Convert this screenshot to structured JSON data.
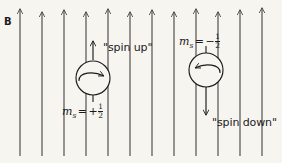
{
  "figure": {
    "background_color": "#f7f5f0",
    "ink_color": "#1b1b1b",
    "width": 282,
    "height": 163
  },
  "field": {
    "label": "B",
    "label_meaning": "magnetic field",
    "arrow_direction": "up",
    "arrow_count": 12,
    "arrow_x_positions": [
      20,
      42,
      64,
      86,
      108,
      130,
      152,
      174,
      196,
      218,
      240,
      262
    ],
    "arrow_top_y": 8,
    "arrow_bottom_y": 156
  },
  "spin_up": {
    "ms_label_prefix": "m",
    "ms_label_subscript": "s",
    "ms_label_equals": "=",
    "ms_label_sign": "+",
    "ms_numerator": "1",
    "ms_denominator": "2",
    "ms_label_plain": "m_s = +1/2",
    "quote_label": "\"spin up\"",
    "moment_arrow_direction": "up",
    "rotation_direction": "clockwise-from-above",
    "circle_center_x": 93,
    "circle_center_y": 78,
    "circle_radius": 17
  },
  "spin_down": {
    "ms_label_prefix": "m",
    "ms_label_subscript": "s",
    "ms_label_equals": "=",
    "ms_label_sign": "−",
    "ms_numerator": "1",
    "ms_denominator": "2",
    "ms_label_plain": "m_s = -1/2",
    "quote_label": "\"spin down\"",
    "moment_arrow_direction": "down",
    "rotation_direction": "counterclockwise-from-above",
    "circle_center_x": 206,
    "circle_center_y": 70,
    "circle_radius": 17
  }
}
